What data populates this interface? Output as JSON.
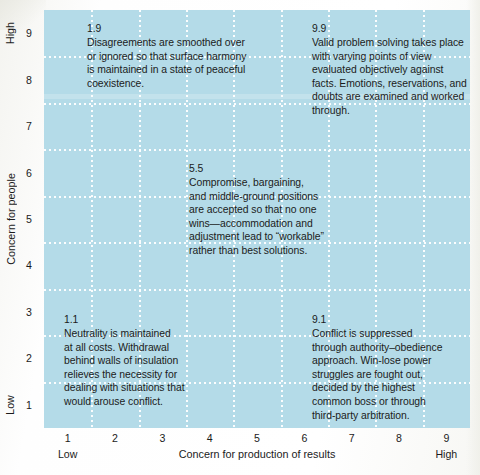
{
  "chart_data": {
    "type": "scatter",
    "title": "",
    "xlabel": "Concern for production of results",
    "ylabel": "Concern for people",
    "xlim": [
      1,
      9
    ],
    "ylim": [
      1,
      9
    ],
    "x_ticks": [
      "1",
      "2",
      "3",
      "4",
      "5",
      "6",
      "7",
      "8",
      "9"
    ],
    "y_ticks": [
      "9",
      "8",
      "7",
      "6",
      "5",
      "4",
      "3",
      "2",
      "1"
    ],
    "x_low_label": "Low",
    "x_high_label": "High",
    "y_low_label": "Low",
    "y_high_label": "High",
    "grid": true,
    "grid_style": "dotted-white",
    "plot_background": "#b4dbe8",
    "annotations": [
      {
        "code": "1.9",
        "x": 1,
        "y": 9,
        "text": "Disagreements are smoothed over\nor ignored so that surface harmony\nis maintained in a state of peaceful\ncoexistence."
      },
      {
        "code": "9.9",
        "x": 9,
        "y": 9,
        "text": "Valid problem solving takes place\nwith varying points of view\nevaluated objectively against\nfacts. Emotions, reservations, and\ndoubts are examined and worked\nthrough."
      },
      {
        "code": "5.5",
        "x": 5,
        "y": 5,
        "text": "Compromise, bargaining,\nand middle-ground positions\nare accepted so that no one\nwins—accommodation and\nadjustment lead to “workable”\nrather than best solutions."
      },
      {
        "code": "1.1",
        "x": 1,
        "y": 1,
        "text": "Neutrality is maintained\nat all costs. Withdrawal\nbehind walls of insulation\nrelieves the necessity for\ndealing with situations that\nwould arouse conflict."
      },
      {
        "code": "9.1",
        "x": 9,
        "y": 1,
        "text": "Conflict is suppressed\nthrough authority–obedience\napproach. Win-lose power\nstruggles are fought out,\ndecided by the highest\ncommon boss or through\nthird-party arbitration."
      }
    ]
  }
}
